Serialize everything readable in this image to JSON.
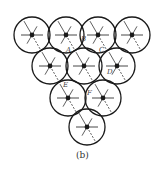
{
  "caption": "(b)",
  "colors": {
    "stroke": "#1a1a1a",
    "label": "#444444",
    "background": "#ffffff"
  },
  "circle_radius": 18,
  "nodes": [
    {
      "id": "r1c1",
      "cx": 32,
      "cy": 35
    },
    {
      "id": "r1c2",
      "cx": 66,
      "cy": 35
    },
    {
      "id": "r1c3",
      "cx": 98,
      "cy": 35
    },
    {
      "id": "r1c4",
      "cx": 132,
      "cy": 35
    },
    {
      "id": "r2c1",
      "cx": 50,
      "cy": 66
    },
    {
      "id": "r2c2",
      "cx": 84,
      "cy": 66
    },
    {
      "id": "r2c3",
      "cx": 117,
      "cy": 66
    },
    {
      "id": "r3c1",
      "cx": 68,
      "cy": 98
    },
    {
      "id": "r3c2",
      "cx": 103,
      "cy": 98
    },
    {
      "id": "r4c1",
      "cx": 87,
      "cy": 127
    }
  ],
  "labels": [
    {
      "text": "A",
      "x": 66,
      "y": 52
    },
    {
      "text": "B",
      "x": 81,
      "y": 41
    },
    {
      "text": "C",
      "x": 99,
      "y": 52
    },
    {
      "text": "D",
      "x": 107,
      "y": 74
    },
    {
      "text": "E",
      "x": 63,
      "y": 87
    },
    {
      "text": "F",
      "x": 87,
      "y": 95
    }
  ]
}
